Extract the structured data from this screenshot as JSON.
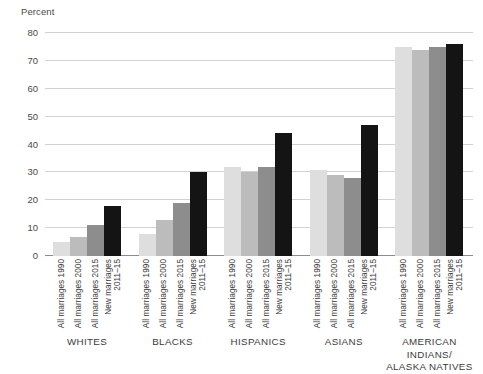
{
  "chart_data": {
    "type": "bar",
    "title": "",
    "subtitle": "",
    "xlabel": "",
    "ylabel": "Percent",
    "ylim": [
      0,
      80
    ],
    "yticks": [
      0,
      10,
      20,
      30,
      40,
      50,
      60,
      70,
      80
    ],
    "ytick_labels": [
      "0",
      "10",
      "20",
      "30",
      "40",
      "50",
      "60",
      "70",
      "80"
    ],
    "grid": true,
    "legend": "none",
    "categories": [
      "WHITES",
      "BLACKS",
      "HISPANICS",
      "ASIANS",
      "AMERICAN INDIANS/\nALASKA NATIVES"
    ],
    "series": [
      {
        "name": "All marriages 1990",
        "color": "#dedede",
        "values": [
          5,
          8,
          32,
          31,
          75
        ]
      },
      {
        "name": "All marriages 2000",
        "color": "#bcbcbc",
        "values": [
          7,
          13,
          30,
          29,
          74
        ]
      },
      {
        "name": "All marriages 2015",
        "color": "#8d8d8d",
        "values": [
          11,
          19,
          32,
          28,
          75
        ]
      },
      {
        "name": "New marriages 2011–15",
        "color": "#141414",
        "values": [
          18,
          30,
          44,
          47,
          76
        ]
      }
    ],
    "tick_labels": [
      {
        "line1": "All marriages 1990",
        "line2": ""
      },
      {
        "line1": "All marriages 2000",
        "line2": ""
      },
      {
        "line1": "All marriages 2015",
        "line2": ""
      },
      {
        "line1": "New marriages",
        "line2": "2011–15"
      }
    ],
    "axis_color": "#8c8c8c",
    "grid_color": "#d2d2d2",
    "background": "#ffffff"
  }
}
